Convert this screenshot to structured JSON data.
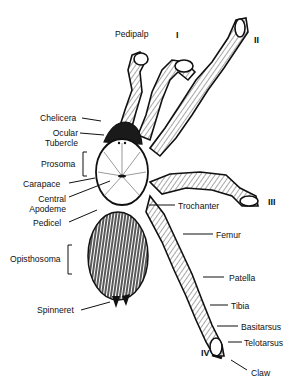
{
  "diagram": {
    "colors": {
      "ink": "#111111",
      "background": "#ffffff"
    },
    "labels_left": [
      {
        "id": "chelicera",
        "text": "Chelicera"
      },
      {
        "id": "ocular-tubercle",
        "text": "Ocular Tubercle",
        "line1": "Ocular",
        "line2": "Tubercle"
      },
      {
        "id": "prosoma",
        "text": "Prosoma"
      },
      {
        "id": "carapace",
        "text": "Carapace"
      },
      {
        "id": "central-apodeme",
        "text": "Central Apodeme",
        "line1": "Central",
        "line2": "Apodeme"
      },
      {
        "id": "pedicel",
        "text": "Pedicel"
      },
      {
        "id": "opisthosoma",
        "text": "Opisthosoma"
      },
      {
        "id": "spinneret",
        "text": "Spinneret"
      }
    ],
    "labels_top": [
      {
        "id": "pedipalp",
        "text": "Pedipalp"
      }
    ],
    "labels_right": [
      {
        "id": "trochanter",
        "text": "Trochanter"
      },
      {
        "id": "femur",
        "text": "Femur"
      },
      {
        "id": "patella",
        "text": "Patella"
      },
      {
        "id": "tibia",
        "text": "Tibia"
      },
      {
        "id": "basitarsus",
        "text": "Basitarsus"
      },
      {
        "id": "telotarsus",
        "text": "Telotarsus"
      },
      {
        "id": "claw",
        "text": "Claw"
      }
    ],
    "leg_numbers": [
      {
        "id": "leg-1",
        "text": "I"
      },
      {
        "id": "leg-2",
        "text": "II"
      },
      {
        "id": "leg-3",
        "text": "III"
      },
      {
        "id": "leg-4",
        "text": "IV"
      }
    ]
  }
}
